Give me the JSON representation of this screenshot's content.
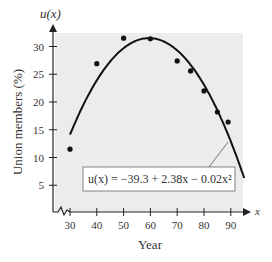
{
  "chart_data": {
    "type": "scatter",
    "title": "",
    "xlabel": "Year",
    "ylabel": "Union members (%)",
    "x_axis_symbol": "x",
    "y_axis_symbol": "u(x)",
    "x_ticks": [
      30,
      40,
      50,
      60,
      70,
      80,
      90
    ],
    "y_ticks": [
      5,
      10,
      15,
      20,
      25,
      30
    ],
    "xlim": [
      25,
      95
    ],
    "ylim": [
      0,
      33
    ],
    "grid": false,
    "axis_break": true,
    "points": [
      {
        "x": 30,
        "y": 11.5
      },
      {
        "x": 40,
        "y": 26.9
      },
      {
        "x": 50,
        "y": 31.5
      },
      {
        "x": 60,
        "y": 31.4
      },
      {
        "x": 70,
        "y": 27.4
      },
      {
        "x": 75,
        "y": 25.6
      },
      {
        "x": 80,
        "y": 22.0
      },
      {
        "x": 85,
        "y": 18.2
      },
      {
        "x": 89,
        "y": 16.4
      }
    ],
    "model": {
      "label": "u(x) = −39.3 + 2.38x − 0.02x²",
      "coefficients": {
        "a": -39.3,
        "b": 2.38,
        "c": -0.02
      },
      "x_range": [
        30,
        95
      ]
    },
    "colors": {
      "plot_bg": "#ececec",
      "curve": "#111111",
      "points": "#111111"
    }
  }
}
